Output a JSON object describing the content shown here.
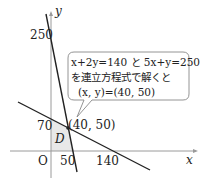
{
  "diagram": {
    "type": "linear-programming-graph",
    "axes": {
      "x_label": "x",
      "y_label": "y",
      "origin_label": "O"
    },
    "ticks": {
      "y": [
        "250",
        "70"
      ],
      "x": [
        "50",
        "140"
      ]
    },
    "lines": [
      {
        "equation": "5x+y=250",
        "x_intercept": 50,
        "y_intercept": 250
      },
      {
        "equation": "x+2y=140",
        "x_intercept": 140,
        "y_intercept": 70
      }
    ],
    "intersection": {
      "label": "(40, 50)",
      "x": 40,
      "y": 50
    },
    "region": {
      "label": "D",
      "vertices": [
        [
          0,
          0
        ],
        [
          0,
          70
        ],
        [
          40,
          50
        ],
        [
          50,
          0
        ]
      ]
    },
    "callout": {
      "line1": "x+2y=140 と 5x+y=250",
      "line2": "を連立方程式で解くと",
      "line3": "(x, y)=(40, 50)"
    },
    "colors": {
      "line": "#222222",
      "axis": "#999999",
      "region_fill": "#e6e6e6",
      "callout_border": "#888888"
    }
  }
}
